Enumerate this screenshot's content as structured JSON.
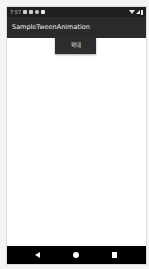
{
  "status_bar": {
    "time": "7:57",
    "left_icons": [
      "notification-icon",
      "notification-icon",
      "settings-icon",
      "sd-card-icon"
    ],
    "right_icons": [
      "wifi-icon",
      "signal-icon",
      "battery-icon"
    ]
  },
  "app_bar": {
    "title": "SampleTweenAnimation"
  },
  "main": {
    "zoom_button_label": "확대"
  },
  "nav_bar": {
    "buttons": [
      "back",
      "home",
      "recents"
    ]
  },
  "colors": {
    "status_bar": "#1f1f1f",
    "app_bar": "#2b2b2b",
    "button": "#2d2d2d",
    "nav_bar": "#000000",
    "background": "#ffffff"
  }
}
